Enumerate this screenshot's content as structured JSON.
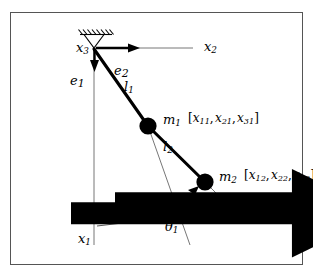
{
  "figure": {
    "type": "double-pendulum-free-body-diagram",
    "background": "#ffffff",
    "border_color": "#555555",
    "line_color": "#000000",
    "thin_line_color": "#777777",
    "mass_color": "#000000",
    "labels": {
      "x1": "x",
      "x1_sub": "1",
      "x2": "x",
      "x2_sub": "2",
      "x3": "x",
      "x3_sub": "3",
      "e1": "e",
      "e1_sub": "1",
      "e2": "e",
      "e2_sub": "2",
      "l1": "l",
      "l1_sub": "1",
      "l2": "l",
      "l2_sub": "2",
      "m1": "m",
      "m1_sub": "1",
      "m2": "m",
      "m2_sub": "2",
      "theta1": "θ",
      "theta1_sub": "1",
      "theta2": "θ",
      "theta2_sub": "2",
      "coords1_open": "[",
      "coords1": "x11, x21, x31",
      "coords1_close": "]",
      "coords2_open": "[",
      "coords2": "x12, x22, x32",
      "coords2_close": "]"
    },
    "coordinate_components_1": [
      "x11",
      "x21",
      "x31"
    ],
    "coordinate_components_2": [
      "x12",
      "x22",
      "x32"
    ],
    "geometry": {
      "pivot": [
        94,
        48
      ],
      "mass1": [
        148,
        126
      ],
      "mass2": [
        205,
        182
      ],
      "x2_axis_end": [
        196,
        48
      ],
      "x1_axis_end": [
        94,
        245
      ],
      "rod1_length_px": 95,
      "rod2_length_px": 80
    }
  }
}
